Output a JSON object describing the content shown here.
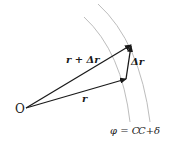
{
  "diagram": {
    "type": "vector-diagram",
    "origin_label": "O",
    "vectors": [
      {
        "name": "r",
        "label": "r",
        "from": [
          26,
          108
        ],
        "to": [
          126,
          79
        ]
      },
      {
        "name": "r_plus_delta_r",
        "label": "r + Δr",
        "from": [
          26,
          108
        ],
        "to": [
          131,
          45
        ]
      },
      {
        "name": "delta_r",
        "label": "Δr",
        "from": [
          126,
          79
        ],
        "to": [
          131,
          45
        ]
      }
    ],
    "curves": [
      {
        "name": "level-curve-C",
        "label": "φ = C"
      },
      {
        "name": "level-curve-C-plus-delta",
        "label": "C+δ"
      }
    ],
    "labels": {
      "origin": "O",
      "r": "r",
      "r_plus_delta_r": "r + Δr",
      "delta_r": "Δr",
      "phi_eq_c": "φ = C",
      "c_plus_delta": "C+δ"
    },
    "colors": {
      "vector": "#1a1a1a",
      "curve": "#bdbdbd",
      "background": "#ffffff"
    }
  }
}
